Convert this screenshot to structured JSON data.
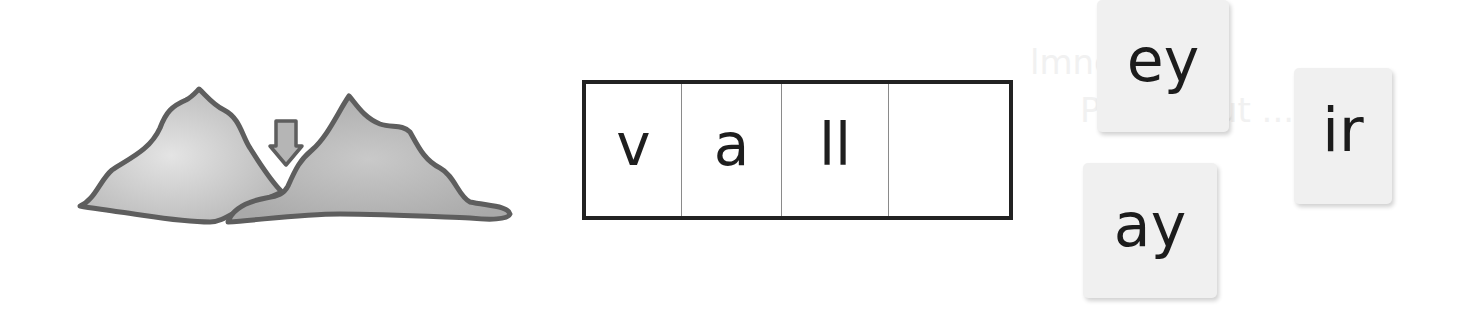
{
  "bleed_through_text": [
    "lmnq  ...",
    "Praw lmut  ...",
    "ǝɹǝɥʇ  ...",
    "ǝɹǝɥʍ  ..."
  ],
  "picture": {
    "subject": "valley",
    "icon": "mountains-valley-icon",
    "pointer_icon": "down-arrow-icon",
    "colors": {
      "outline": "#5e5e5e",
      "fill_light": "#dedede",
      "fill_dark": "#ababab",
      "arrow_fill": "#b5b5b5"
    }
  },
  "word_builder": {
    "cells": [
      {
        "text": "v"
      },
      {
        "text": "a"
      },
      {
        "text": "ll"
      },
      {
        "text": ""
      }
    ]
  },
  "letter_cards": [
    {
      "id": "ey",
      "text": "ey"
    },
    {
      "id": "ir",
      "text": "ir"
    },
    {
      "id": "ay",
      "text": "ay"
    }
  ]
}
